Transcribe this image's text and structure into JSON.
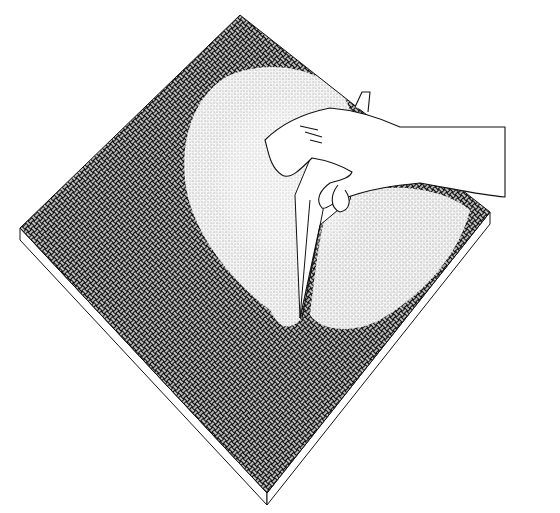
{
  "illustration": {
    "subject": "hand peeling back a textured surface layer from a square tile",
    "style": "black-and-white line drawing with woven crosshatch texture",
    "colors": {
      "background": "#ffffff",
      "ink": "#111111",
      "stipple": "#bdbdbd"
    }
  }
}
